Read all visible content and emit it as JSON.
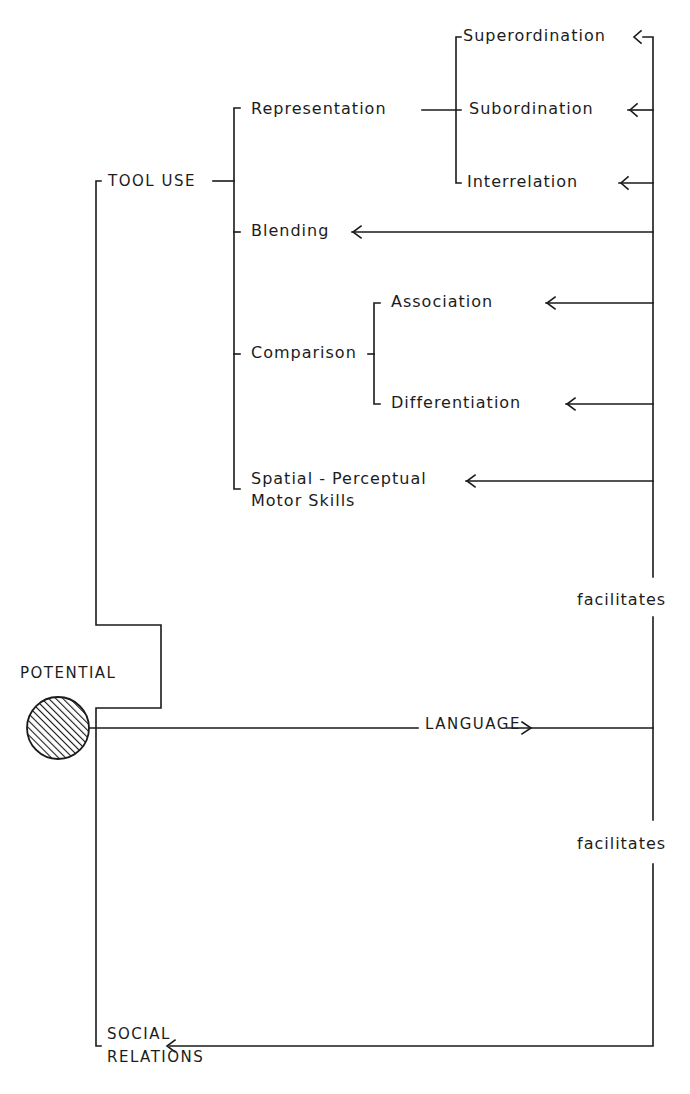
{
  "diagram": {
    "root": {
      "label": "POTENTIAL",
      "icon": "hatched-circle"
    },
    "branches": {
      "tool_use": {
        "label": "TOOL USE"
      },
      "language": {
        "label": "LANGUAGE"
      },
      "social_relations": {
        "line1": "SOCIAL",
        "line2": "RELATIONS"
      }
    },
    "tool_use_children": {
      "representation": "Representation",
      "blending": "Blending",
      "comparison": "Comparison",
      "spatial_line1": "Spatial - Perceptual",
      "spatial_line2": "Motor Skills"
    },
    "representation_children": {
      "superordination": "Superordination",
      "subordination": "Subordination",
      "interrelation": "Interrelation"
    },
    "comparison_children": {
      "association": "Association",
      "differentiation": "Differentiation"
    },
    "relations": {
      "facilitates_upper": "facilitates",
      "facilitates_lower": "facilitates"
    }
  }
}
